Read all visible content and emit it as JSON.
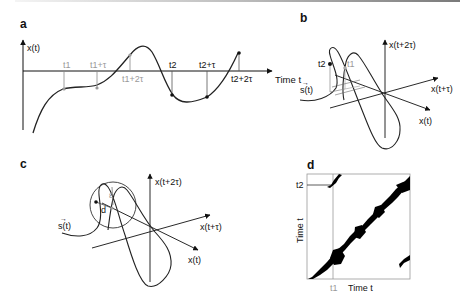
{
  "panels": {
    "a": {
      "letter": "a",
      "y_label": "x(t)",
      "x_label": "Time t",
      "ticks_gray": [
        "t1",
        "t1+τ",
        "t1+2τ"
      ],
      "ticks_black": [
        "t2",
        "t2+τ",
        "t2+2τ"
      ]
    },
    "b": {
      "letter": "b",
      "axis_z": "x(t+2τ)",
      "axis_y": "x(t+τ)",
      "axis_x": "x(t)",
      "trajectory": "s(t)",
      "point_black": "t2",
      "point_gray": "t1"
    },
    "c": {
      "letter": "c",
      "axis_z": "x(t+2τ)",
      "axis_y": "x(t+τ)",
      "axis_x": "x(t)",
      "trajectory": "s(t)",
      "radius_label": "ε",
      "distance_label": "d"
    },
    "d": {
      "letter": "d",
      "y_label": "Time t",
      "x_label": "Time t",
      "tick_y": "t2",
      "tick_x": "t1"
    }
  }
}
